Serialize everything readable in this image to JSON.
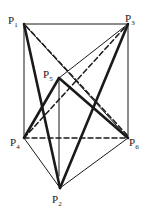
{
  "diagram": {
    "type": "prism-with-points",
    "colors": {
      "ink": "#1a1a1a",
      "background": "#ffffff"
    },
    "points": {
      "P1": {
        "label": "P",
        "sub": "1",
        "x": 24,
        "y": 24
      },
      "P3": {
        "label": "P",
        "sub": "3",
        "x": 128,
        "y": 24
      },
      "P5": {
        "label": "P",
        "sub": "5",
        "x": 59,
        "y": 78
      },
      "P4": {
        "label": "P",
        "sub": "4",
        "x": 24,
        "y": 138
      },
      "P6": {
        "label": "P",
        "sub": "6",
        "x": 128,
        "y": 138
      },
      "P2": {
        "label": "P",
        "sub": "2",
        "x": 60,
        "y": 188
      }
    },
    "edges": {
      "thin": [
        [
          "P1",
          "P3"
        ],
        [
          "P1",
          "P4"
        ],
        [
          "P3",
          "P6"
        ],
        [
          "P5",
          "P5base"
        ],
        [
          "P1",
          "P6"
        ],
        [
          "P5",
          "P3"
        ],
        [
          "P4",
          "P2"
        ],
        [
          "P6",
          "P2"
        ]
      ],
      "thick": [
        [
          "P1",
          "P2"
        ],
        [
          "P3",
          "P2"
        ],
        [
          "P4",
          "P5"
        ],
        [
          "P5",
          "P6"
        ]
      ],
      "dashed": [
        [
          "P1",
          "P6"
        ],
        [
          "P4",
          "P3"
        ],
        [
          "P4",
          "P6"
        ]
      ]
    }
  }
}
